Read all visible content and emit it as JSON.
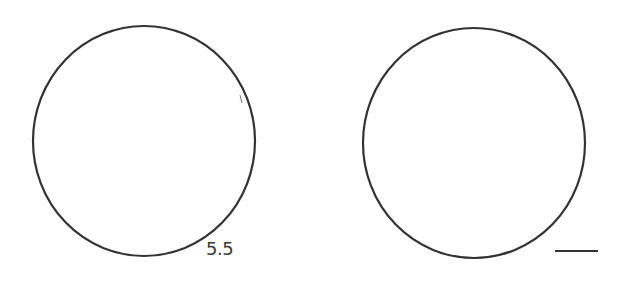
{
  "diagram": {
    "background": "#ffffff",
    "stroke_color": "#333333",
    "shapes": [
      {
        "id": "left-circle",
        "type": "circle",
        "cx": 144,
        "cy": 141,
        "rx": 111,
        "ry": 115,
        "label": "5.5"
      },
      {
        "id": "right-circle",
        "type": "circle",
        "cx": 474,
        "cy": 143,
        "rx": 111,
        "ry": 115,
        "label": ""
      }
    ],
    "left_label": "5.5",
    "scale_bar": {
      "x1": 555,
      "x2": 598,
      "y": 251
    }
  }
}
